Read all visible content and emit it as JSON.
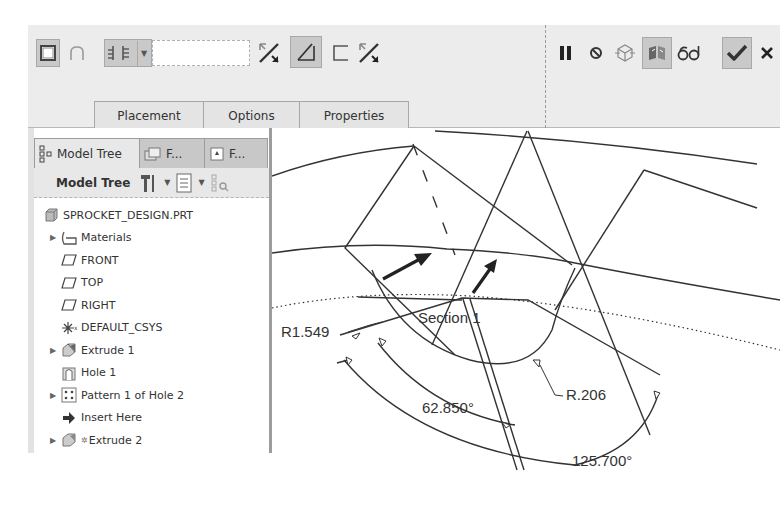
{
  "ribbon": {
    "tools_left": [
      {
        "name": "solid-icon",
        "pressed": true
      },
      {
        "name": "surface-icon",
        "pressed": false
      },
      {
        "name": "depth-option-icon",
        "pressed": true,
        "has_dropdown": true
      }
    ],
    "depth_input": {
      "value": "",
      "placeholder": ""
    },
    "tools_mid": [
      {
        "name": "flip-depth-direction-icon",
        "pressed": false
      },
      {
        "name": "remove-material-icon",
        "pressed": true
      },
      {
        "name": "thicken-sketch-icon",
        "pressed": false
      },
      {
        "name": "flip-material-side-icon",
        "pressed": false
      }
    ],
    "tools_right": [
      {
        "name": "pause-icon"
      },
      {
        "name": "no-preview-icon"
      },
      {
        "name": "geometry-preview-icon"
      },
      {
        "name": "feature-preview-icon",
        "pressed": true
      },
      {
        "name": "verify-icon"
      },
      {
        "name": "ok-icon",
        "pressed": true
      },
      {
        "name": "cancel-icon"
      }
    ],
    "tabs": [
      {
        "label": "Placement"
      },
      {
        "label": "Options"
      },
      {
        "label": "Properties"
      }
    ]
  },
  "navigator": {
    "tabs": [
      {
        "label": "Model Tree",
        "active": true,
        "icon": "model-tree-icon"
      },
      {
        "label": "F...",
        "active": false,
        "icon": "folder-browser-icon"
      },
      {
        "label": "F...",
        "active": false,
        "icon": "favorites-icon"
      }
    ],
    "toolbar": {
      "title": "Model Tree",
      "settings_icon": "tree-settings-icon",
      "show_icon": "tree-show-icon",
      "filter_icon": "tree-filter-icon"
    },
    "items": [
      {
        "label": "SPROCKET_DESIGN.PRT",
        "icon": "part-icon",
        "expandable": false,
        "indent": 0
      },
      {
        "label": "Materials",
        "icon": "materials-icon",
        "expandable": true,
        "indent": 1
      },
      {
        "label": "FRONT",
        "icon": "datum-plane-icon",
        "expandable": false,
        "indent": 1
      },
      {
        "label": "TOP",
        "icon": "datum-plane-icon",
        "expandable": false,
        "indent": 1
      },
      {
        "label": "RIGHT",
        "icon": "datum-plane-icon",
        "expandable": false,
        "indent": 1
      },
      {
        "label": "DEFAULT_CSYS",
        "icon": "csys-icon",
        "expandable": false,
        "indent": 1
      },
      {
        "label": "Extrude 1",
        "icon": "extrude-icon",
        "expandable": true,
        "indent": 1
      },
      {
        "label": "Hole 1",
        "icon": "hole-icon",
        "expandable": false,
        "indent": 1
      },
      {
        "label": "Pattern 1 of Hole 2",
        "icon": "pattern-icon",
        "expandable": true,
        "indent": 1
      },
      {
        "label": "Insert Here",
        "icon": "insert-arrow-icon",
        "expandable": false,
        "indent": 1
      },
      {
        "label": "Extrude 2",
        "icon": "extrude-icon",
        "expandable": true,
        "indent": 1,
        "in_progress": true
      }
    ]
  },
  "graphics": {
    "section_label": "Section 1",
    "dimensions": [
      {
        "label": "R1.549",
        "type": "radius"
      },
      {
        "label": "R.206",
        "type": "radius"
      },
      {
        "label": "62.850°",
        "type": "angle"
      },
      {
        "label": "125.700°",
        "type": "angle"
      }
    ],
    "colors": {
      "geometry": "#333333",
      "background": "#ffffff"
    }
  }
}
